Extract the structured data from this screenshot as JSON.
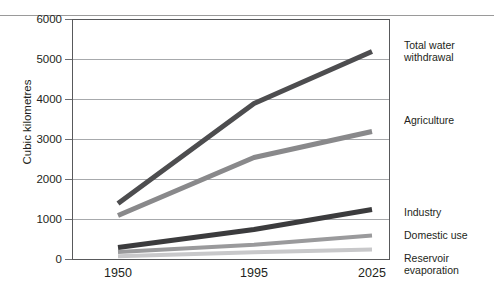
{
  "figure": {
    "partial_title_fragment": "",
    "y_axis_title": "Cubic kilometres"
  },
  "chart_data": {
    "type": "line",
    "title": "",
    "xlabel": "",
    "ylabel": "Cubic kilometres",
    "x": [
      1950,
      1995,
      2025
    ],
    "xtick_labels": [
      "1950",
      "1995",
      "2025"
    ],
    "ytick_labels": [
      "0",
      "1000",
      "2000",
      "3000",
      "4000",
      "5000",
      "6000"
    ],
    "yticks": [
      0,
      1000,
      2000,
      3000,
      4000,
      5000,
      6000
    ],
    "ylim": [
      0,
      6000
    ],
    "grid": "horizontal",
    "legend_position": "right-of-axis-inline-labels",
    "series": [
      {
        "name": "Total water withdrawal",
        "label_line_1": "Total water",
        "label_line_2": "withdrawal",
        "color": "#4d4d4f",
        "values": [
          1400,
          3900,
          5200
        ]
      },
      {
        "name": "Agriculture",
        "label_line_1": "Agriculture",
        "label_line_2": "",
        "color": "#89898b",
        "values": [
          1100,
          2550,
          3200
        ]
      },
      {
        "name": "Industry",
        "label_line_1": "Industry",
        "label_line_2": "",
        "color": "#3b3b3d",
        "values": [
          300,
          750,
          1250
        ]
      },
      {
        "name": "Domestic use",
        "label_line_1": "Domestic use",
        "label_line_2": "",
        "color": "#9a9a9c",
        "values": [
          190,
          370,
          600
        ]
      },
      {
        "name": "Reservoir evaporation",
        "label_line_1": "Reservoir",
        "label_line_2": "evaporation",
        "color": "#c8c8ca",
        "values": [
          80,
          180,
          250
        ]
      }
    ]
  }
}
